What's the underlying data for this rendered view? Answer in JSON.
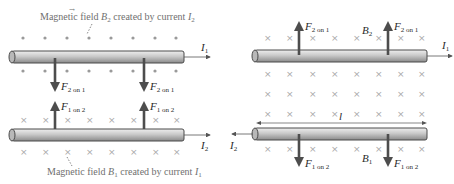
{
  "left_panel": {
    "top_caption": "Magnetic field B⃗₂ created by current I₂",
    "top_caption_parts": {
      "prefix": "Magnetic field ",
      "vec": "B",
      "vec_sub": "2",
      "mid": " created by current ",
      "cur": "I",
      "cur_sub": "2"
    },
    "bottom_caption_parts": {
      "prefix": "Magnetic field ",
      "vec": "B",
      "vec_sub": "1",
      "mid": " created by current ",
      "cur": "I",
      "cur_sub": "1"
    },
    "wire_top_current": {
      "symbol": "I",
      "sub": "1",
      "direction": "right"
    },
    "wire_bottom_current": {
      "symbol": "I",
      "sub": "2",
      "direction": "right"
    },
    "force_top": {
      "symbol": "F",
      "sub": "2 on 1",
      "direction": "down"
    },
    "force_bottom": {
      "symbol": "F",
      "sub": "1 on 2",
      "direction": "up"
    },
    "field_top": "dots (out of page)",
    "field_bottom": "crosses (into page)"
  },
  "right_panel": {
    "wire_top_current": {
      "symbol": "I",
      "sub": "1",
      "direction": "right"
    },
    "wire_bottom_current": {
      "symbol": "I",
      "sub": "2",
      "direction": "left"
    },
    "force_top": {
      "symbol": "F",
      "sub": "2 on 1",
      "direction": "up"
    },
    "force_bottom": {
      "symbol": "F",
      "sub": "1 on 2",
      "direction": "down"
    },
    "field_label_top": {
      "symbol": "B",
      "sub": "2"
    },
    "field_label_bottom": {
      "symbol": "B",
      "sub": "1"
    },
    "length_label": "l",
    "field": "crosses (into page)"
  },
  "colors": {
    "wire_fill": "#c8c8c8",
    "wire_stroke": "#4a4a4a",
    "arrow": "#4d4d4d",
    "field_marker": "#a8a8a8",
    "caption": "#6f6f6f"
  }
}
